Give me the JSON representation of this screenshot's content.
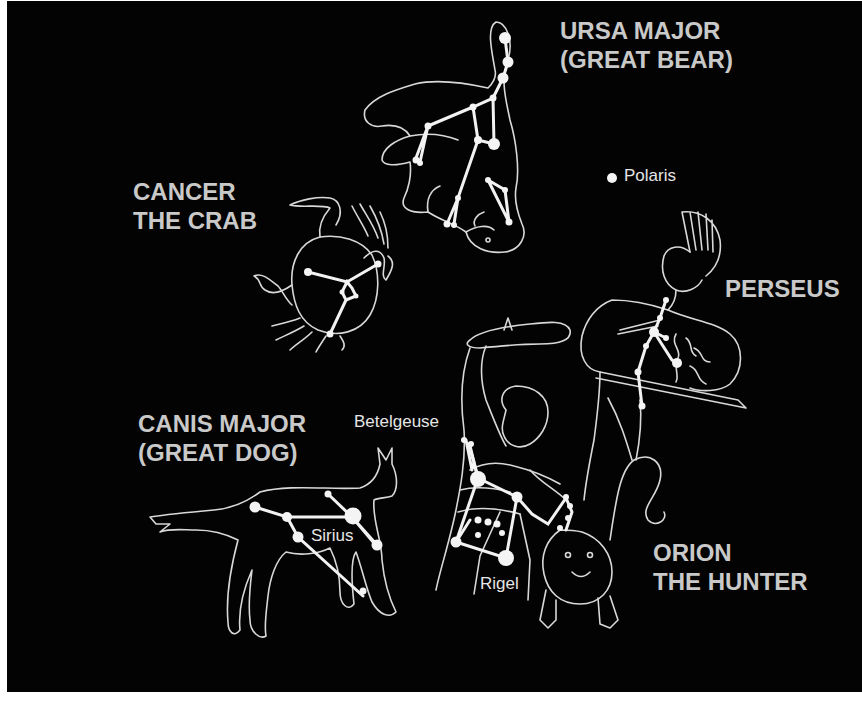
{
  "figure": {
    "type": "constellation-illustration",
    "background_color": "#030303",
    "text_color": "#c9c9c9"
  },
  "constellations": [
    {
      "id": "ursa-major",
      "title_line1": "URSA MAJOR",
      "title_line2": "(GREAT BEAR)",
      "figure": "bear"
    },
    {
      "id": "cancer",
      "title_line1": "CANCER",
      "title_line2": "THE CRAB",
      "figure": "crab"
    },
    {
      "id": "perseus",
      "title_line1": "PERSEUS",
      "figure": "warrior with sword and Medusa head"
    },
    {
      "id": "canis-major",
      "title_line1": "CANIS MAJOR",
      "title_line2": "(GREAT DOG)",
      "figure": "dog"
    },
    {
      "id": "orion",
      "title_line1": "ORION",
      "title_line2": "THE HUNTER",
      "figure": "hunter with club and lion"
    }
  ],
  "stars": {
    "polaris": "Polaris",
    "betelgeuse": "Betelgeuse",
    "sirius": "Sirius",
    "rigel": "Rigel"
  }
}
